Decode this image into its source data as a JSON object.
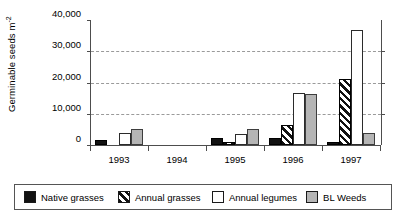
{
  "chart_data": {
    "type": "bar",
    "title": "",
    "subtitle": "",
    "xlabel": "",
    "ylabel": "Germinable seeds m",
    "ylabel_exponent": "-2",
    "categories": [
      "1993",
      "1994",
      "1995",
      "1996",
      "1997"
    ],
    "series": [
      {
        "name": "Native grasses",
        "values": [
          1500,
          0,
          2200,
          2300,
          1000
        ]
      },
      {
        "name": "Annual grasses",
        "values": [
          0,
          0,
          900,
          6500,
          21000
        ]
      },
      {
        "name": "Annual legumes",
        "values": [
          3900,
          0,
          3500,
          16700,
          36800
        ]
      },
      {
        "name": "BL Weeds",
        "values": [
          5200,
          0,
          5200,
          16300,
          4000
        ]
      }
    ],
    "ylim": [
      0,
      40000
    ],
    "yticks": [
      0,
      10000,
      20000,
      30000,
      40000
    ],
    "ytick_labels": [
      "0",
      "10,000",
      "20,000",
      "30,000",
      "40,000"
    ],
    "grid": true,
    "grid_style": "dashed-horizontal",
    "legend_position": "bottom",
    "legend": [
      {
        "label": "Native grasses",
        "pattern": "solid-black",
        "color": "#121212"
      },
      {
        "label": "Annual grasses",
        "pattern": "diagonal-hatch",
        "color": "#111111"
      },
      {
        "label": "Annual legumes",
        "pattern": "open-white",
        "color": "#ffffff"
      },
      {
        "label": "BL Weeds",
        "pattern": "solid-gray",
        "color": "#b5b5b5"
      }
    ]
  }
}
